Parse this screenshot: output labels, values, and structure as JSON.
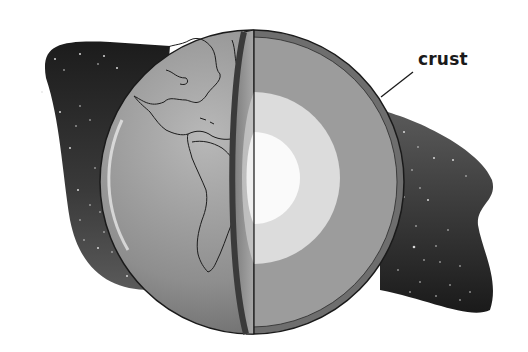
{
  "diagram": {
    "labels": [
      {
        "id": "crust",
        "text": "crust",
        "x": 418,
        "y": 48
      }
    ],
    "layers": [
      {
        "name": "crust",
        "color": "#6e6e6e"
      },
      {
        "name": "mantle",
        "color": "#9c9c9c"
      },
      {
        "name": "outer core",
        "color": "#dcdcdc"
      },
      {
        "name": "inner core",
        "color": "#fafafa"
      }
    ],
    "background": {
      "space_color": "#2a2a2a",
      "page_color": "#ffffff"
    }
  }
}
